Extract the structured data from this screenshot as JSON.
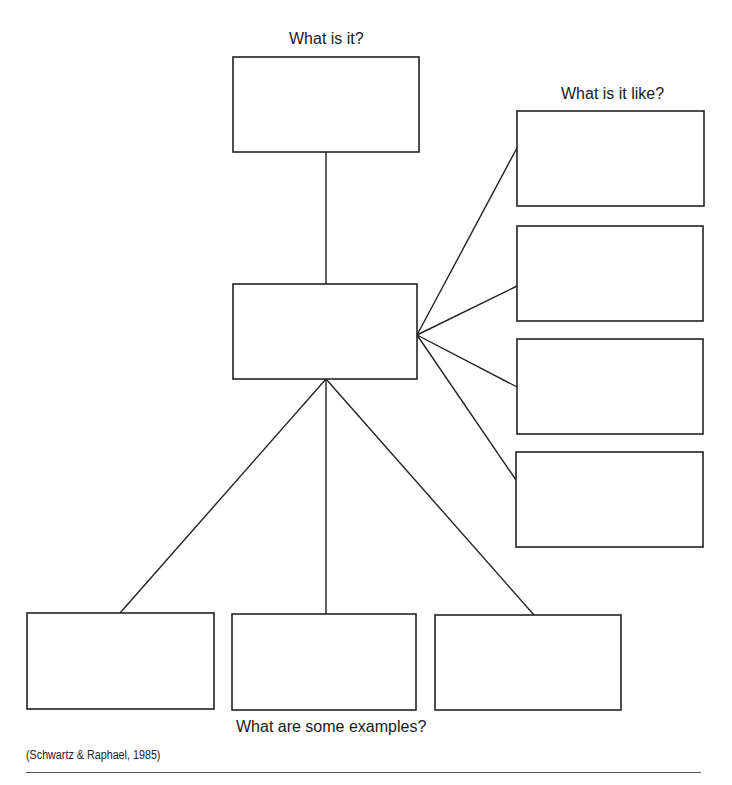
{
  "labels": {
    "what_is_it": "What is it?",
    "what_is_it_like": "What is it like?",
    "examples": "What are some examples?",
    "citation": "(Schwartz & Raphael, 1985)"
  },
  "colors": {
    "stroke": "#222222",
    "background": "#ffffff",
    "rule": "#555555"
  },
  "boxes": {
    "definition": {
      "x": 233,
      "y": 57,
      "w": 186,
      "h": 95
    },
    "concept": {
      "x": 233,
      "y": 284,
      "w": 184,
      "h": 95
    },
    "properties": [
      {
        "x": 517,
        "y": 111,
        "w": 187,
        "h": 95
      },
      {
        "x": 517,
        "y": 226,
        "w": 186,
        "h": 95
      },
      {
        "x": 517,
        "y": 339,
        "w": 186,
        "h": 95
      },
      {
        "x": 516,
        "y": 452,
        "w": 187,
        "h": 95
      }
    ],
    "examples": [
      {
        "x": 27,
        "y": 613,
        "w": 187,
        "h": 96
      },
      {
        "x": 232,
        "y": 614,
        "w": 184,
        "h": 96
      },
      {
        "x": 435,
        "y": 615,
        "w": 186,
        "h": 95
      }
    ]
  },
  "connectors": {
    "definition": {
      "x1": 326,
      "y1": 152,
      "x2": 326,
      "y2": 284
    },
    "properties": [
      {
        "x1": 417,
        "y1": 335,
        "x2": 517,
        "y2": 148
      },
      {
        "x1": 417,
        "y1": 335,
        "x2": 517,
        "y2": 286
      },
      {
        "x1": 417,
        "y1": 335,
        "x2": 517,
        "y2": 387
      },
      {
        "x1": 417,
        "y1": 335,
        "x2": 516,
        "y2": 480
      }
    ],
    "examples": [
      {
        "x1": 326,
        "y1": 379,
        "x2": 120,
        "y2": 613
      },
      {
        "x1": 326,
        "y1": 379,
        "x2": 326,
        "y2": 614
      },
      {
        "x1": 326,
        "y1": 379,
        "x2": 534,
        "y2": 615
      }
    ]
  },
  "layout": {
    "what_is_it_pos": {
      "left": 289,
      "top": 30
    },
    "what_is_it_like_pos": {
      "left": 561,
      "top": 85
    },
    "examples_pos": {
      "left": 236,
      "top": 718
    },
    "citation_pos": {
      "left": 26,
      "top": 748
    },
    "rule": {
      "left": 26,
      "top": 772,
      "width": 675
    }
  }
}
